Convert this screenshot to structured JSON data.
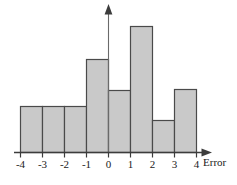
{
  "chart_data": {
    "type": "bar",
    "title": "",
    "subtitle": "",
    "xlabel": "Error",
    "ylabel": "",
    "grid": false,
    "legend": null,
    "bin_edges": [
      -4,
      -3,
      -2,
      -1,
      0,
      1,
      2,
      3,
      4
    ],
    "categories": [
      "-4 to -3",
      "-3 to -2",
      "-2 to -1",
      "-1 to 0",
      "0 to 1",
      "1 to 2",
      "2 to 3",
      "3 to 4"
    ],
    "values": [
      46,
      46,
      46,
      93,
      62,
      126,
      32,
      63
    ],
    "xlim": [
      -4,
      4
    ],
    "ylim": [
      0,
      147
    ],
    "xticklabels": [
      "-4",
      "-3",
      "-2",
      "-1",
      "0",
      "1",
      "2",
      "3",
      "4"
    ],
    "yticklabels": [],
    "bar_fill_color": "#c9c9c9",
    "bar_border_color": "#4a4a4a",
    "axis_color": "#4a4a4a"
  },
  "axes": {
    "x_axis_label": "Error",
    "x_ticks": [
      {
        "label": "-4",
        "value": -4
      },
      {
        "label": "-3",
        "value": -3
      },
      {
        "label": "-2",
        "value": -2
      },
      {
        "label": "-1",
        "value": -1
      },
      {
        "label": "0",
        "value": 0
      },
      {
        "label": "1",
        "value": 1
      },
      {
        "label": "2",
        "value": 2
      },
      {
        "label": "3",
        "value": 3
      },
      {
        "label": "4",
        "value": 4
      }
    ]
  }
}
